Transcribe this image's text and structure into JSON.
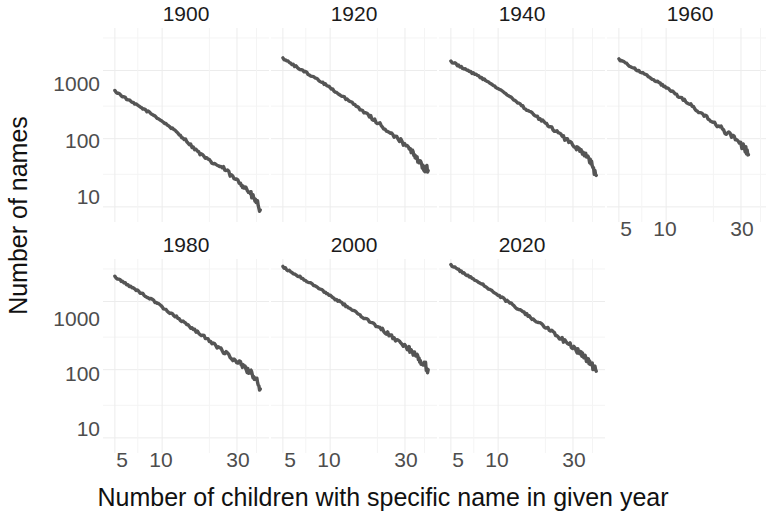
{
  "chart_data": {
    "type": "line",
    "title": "",
    "xlabel": "Number of children with specific name in given year",
    "ylabel": "Number of names",
    "xscale": "log",
    "yscale": "log",
    "grid": true,
    "legend": false,
    "xlim": [
      4.2,
      48
    ],
    "ylim": [
      6,
      4200
    ],
    "xticks": [
      5,
      10,
      30
    ],
    "xtick_labels": [
      "5",
      "10",
      "30"
    ],
    "yticks": [
      10,
      100,
      1000
    ],
    "ytick_labels": [
      "10",
      "100",
      "1000"
    ],
    "facet_variable": "year",
    "facet_layout": "2 rows x 4 columns",
    "panels": [
      {
        "title": "1900",
        "row": 0,
        "col": 0,
        "x": [
          5,
          5.6,
          6.3,
          7.1,
          8,
          9,
          10,
          11.2,
          12.6,
          14.1,
          15.8,
          17.8,
          20,
          22.4,
          25.1,
          28.2,
          31.6,
          33.5,
          35.5,
          37.6,
          39.8,
          42.2
        ],
        "y": [
          500,
          420,
          350,
          300,
          255,
          215,
          180,
          150,
          120,
          96,
          74,
          58,
          47,
          41,
          36,
          27,
          22,
          20,
          17,
          14,
          12,
          9
        ]
      },
      {
        "title": "1920",
        "row": 0,
        "col": 1,
        "x": [
          5,
          5.6,
          6.3,
          7.1,
          8,
          9,
          10,
          11.2,
          12.6,
          14.1,
          15.8,
          17.8,
          20,
          22.4,
          25.1,
          28.2,
          31.6,
          33.5,
          35.5,
          37.6,
          39.8,
          42.2
        ],
        "y": [
          1500,
          1280,
          1080,
          920,
          780,
          660,
          560,
          470,
          390,
          320,
          265,
          215,
          175,
          140,
          115,
          93,
          74,
          62,
          52,
          44,
          38,
          34
        ]
      },
      {
        "title": "1940",
        "row": 0,
        "col": 2,
        "x": [
          5,
          5.6,
          6.3,
          7.1,
          8,
          9,
          10,
          11.2,
          12.6,
          14.1,
          15.8,
          17.8,
          20,
          22.4,
          25.1,
          28.2,
          31.6,
          33.5,
          35.5,
          37.6,
          39.8,
          42.2
        ],
        "y": [
          1350,
          1180,
          1010,
          880,
          760,
          640,
          540,
          450,
          370,
          305,
          250,
          205,
          168,
          137,
          112,
          92,
          74,
          64,
          58,
          52,
          40,
          29
        ]
      },
      {
        "title": "1960",
        "row": 0,
        "col": 3,
        "x": [
          5,
          5.6,
          6.3,
          7.1,
          8,
          9,
          10,
          11.2,
          12.6,
          14.1,
          15.8,
          17.8,
          20,
          22.4,
          25.1,
          28.2,
          31.6,
          33.5
        ],
        "y": [
          1450,
          1250,
          1070,
          920,
          780,
          660,
          560,
          470,
          390,
          320,
          262,
          212,
          172,
          140,
          114,
          92,
          72,
          58
        ]
      },
      {
        "title": "1980",
        "row": 1,
        "col": 0,
        "x": [
          5,
          5.6,
          6.3,
          7.1,
          8,
          9,
          10,
          11.2,
          12.6,
          14.1,
          15.8,
          17.8,
          20,
          22.4,
          25.1,
          28.2,
          31.6,
          33.5,
          35.5,
          37.6,
          39.8,
          42.2
        ],
        "y": [
          2300,
          1950,
          1650,
          1400,
          1180,
          990,
          830,
          690,
          575,
          475,
          395,
          325,
          268,
          220,
          178,
          145,
          122,
          108,
          95,
          86,
          72,
          52
        ]
      },
      {
        "title": "2000",
        "row": 1,
        "col": 1,
        "x": [
          5,
          5.6,
          6.3,
          7.1,
          8,
          9,
          10,
          11.2,
          12.6,
          14.1,
          15.8,
          17.8,
          20,
          22.4,
          25.1,
          28.2,
          31.6,
          33.5,
          35.5,
          37.6,
          39.8,
          42.2
        ],
        "y": [
          3200,
          2750,
          2350,
          2000,
          1700,
          1440,
          1220,
          1030,
          870,
          730,
          615,
          515,
          430,
          360,
          300,
          250,
          205,
          180,
          158,
          135,
          118,
          100
        ]
      },
      {
        "title": "2020",
        "row": 1,
        "col": 2,
        "x": [
          5,
          5.6,
          6.3,
          7.1,
          8,
          9,
          10,
          11.2,
          12.6,
          14.1,
          15.8,
          17.8,
          20,
          22.4,
          25.1,
          28.2,
          31.6,
          33.5,
          35.5,
          37.6,
          39.8,
          42.2
        ],
        "y": [
          3400,
          2900,
          2450,
          2080,
          1760,
          1480,
          1240,
          1040,
          870,
          725,
          605,
          505,
          420,
          348,
          288,
          238,
          196,
          172,
          152,
          130,
          112,
          95
        ]
      }
    ]
  },
  "axes": {
    "y_title": "Number of names",
    "x_title": "Number of children with specific name in given year",
    "y_tick_labels": [
      "1000",
      "100",
      "10"
    ],
    "x_tick_labels": [
      "5",
      "10",
      "30"
    ]
  },
  "panel_titles": {
    "p1900": "1900",
    "p1920": "1920",
    "p1940": "1940",
    "p1960": "1960",
    "p1980": "1980",
    "p2000": "2000",
    "p2020": "2020"
  },
  "colors": {
    "series": "#555555",
    "grid": "#ececec",
    "text": "#1a1a1a",
    "tick_text": "#4d4d4d",
    "background": "#ffffff"
  }
}
